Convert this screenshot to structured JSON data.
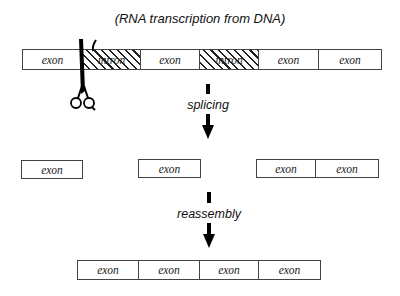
{
  "title": "(RNA transcription from DNA)",
  "rows": {
    "transcript": {
      "segments": [
        {
          "type": "exon",
          "label": "exon"
        },
        {
          "type": "intron",
          "label": "intron"
        },
        {
          "type": "exon",
          "label": "exon"
        },
        {
          "type": "intron",
          "label": "intron"
        },
        {
          "type": "exon",
          "label": "exon"
        },
        {
          "type": "exon",
          "label": "exon"
        }
      ]
    },
    "spliced": {
      "groups": [
        {
          "segments": [
            {
              "label": "exon"
            }
          ]
        },
        {
          "segments": [
            {
              "label": "exon"
            }
          ]
        },
        {
          "segments": [
            {
              "label": "exon"
            },
            {
              "label": "exon"
            }
          ]
        }
      ]
    },
    "reassembled": {
      "segments": [
        {
          "label": "exon"
        },
        {
          "label": "exon"
        },
        {
          "label": "exon"
        },
        {
          "label": "exon"
        }
      ]
    }
  },
  "steps": {
    "splicing": "splicing",
    "reassembly": "reassembly"
  },
  "icons": {
    "scissors": "scissors-icon"
  }
}
